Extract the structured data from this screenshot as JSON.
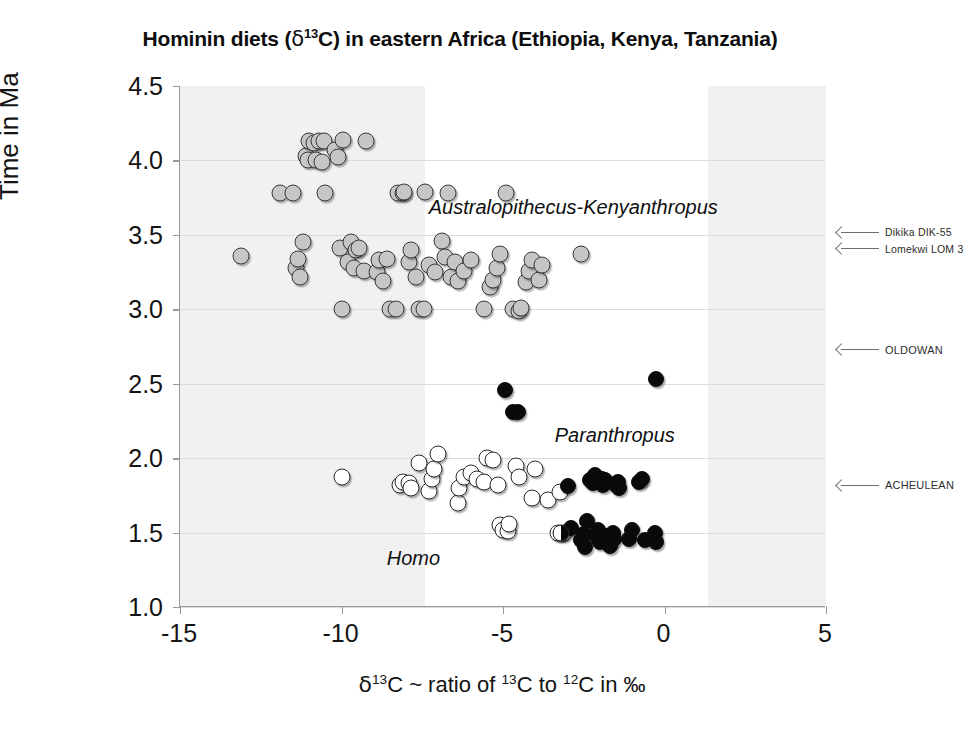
{
  "chart_data": {
    "type": "scatter",
    "title": "Hominin diets (δ13C) in eastern Africa (Ethiopia, Kenya, Tanzania)",
    "title_parts": {
      "pre": "Hominin diets (",
      "delta": "δ",
      "sup": "13",
      "mid": "C) in eastern Africa (Ethiopia, Kenya, Tanzania)"
    },
    "xlabel": "δ13C ~ ratio of 13C to 12C in ‰",
    "xlabel_parts": {
      "delta": "δ",
      "sup1": "13",
      "t1": "C ~ ratio of ",
      "sup2": "13",
      "t2": "C to ",
      "sup3": "12",
      "t3": "C in ‰"
    },
    "ylabel": "Time in Ma",
    "xlim": [
      -15,
      5
    ],
    "ylim": [
      4.5,
      1.0
    ],
    "y_inverted": true,
    "xticks": [
      -15,
      -10,
      -5,
      0,
      5
    ],
    "xtick_labels": [
      "-15",
      "-10",
      "-5",
      "0",
      "5"
    ],
    "yticks": [
      1.0,
      1.5,
      2.0,
      2.5,
      3.0,
      3.5,
      4.0,
      4.5
    ],
    "ytick_labels": [
      "1.0",
      "1.5",
      "2.0",
      "2.5",
      "3.0",
      "3.5",
      "4.0",
      "4.5"
    ],
    "grid": "horizontal",
    "legend": "none",
    "shaded_bands": [
      {
        "name": "C4-poor-band",
        "x_from": -15,
        "x_to": -7.4,
        "color": "#f1f1f1"
      },
      {
        "name": "C4-rich-band",
        "x_from": 1.35,
        "x_to": 5,
        "color": "#f1f1f1"
      }
    ],
    "series": [
      {
        "name": "Homo",
        "marker": "open-circle",
        "color": "#ffffff",
        "edge_color": "#2b2b2b",
        "points": [
          [
            -10.0,
            1.87
          ],
          [
            -8.2,
            1.82
          ],
          [
            -8.1,
            1.84
          ],
          [
            -7.9,
            1.83
          ],
          [
            -7.85,
            1.8
          ],
          [
            -7.6,
            1.97
          ],
          [
            -7.3,
            1.78
          ],
          [
            -7.2,
            1.86
          ],
          [
            -7.15,
            1.93
          ],
          [
            -7.0,
            2.03
          ],
          [
            -6.4,
            1.7
          ],
          [
            -6.35,
            1.8
          ],
          [
            -6.2,
            1.87
          ],
          [
            -6.0,
            1.9
          ],
          [
            -5.8,
            1.86
          ],
          [
            -5.6,
            1.84
          ],
          [
            -5.5,
            2.0
          ],
          [
            -5.3,
            1.99
          ],
          [
            -5.15,
            1.82
          ],
          [
            -5.1,
            1.55
          ],
          [
            -5.0,
            1.52
          ],
          [
            -4.85,
            1.51
          ],
          [
            -4.8,
            1.56
          ],
          [
            -4.6,
            1.95
          ],
          [
            -4.5,
            1.87
          ],
          [
            -4.1,
            1.73
          ],
          [
            -4.0,
            1.93
          ],
          [
            -3.6,
            1.72
          ],
          [
            -3.3,
            1.5
          ],
          [
            -3.25,
            1.77
          ],
          [
            -3.1,
            1.5
          ]
        ]
      },
      {
        "name": "Paranthropus",
        "marker": "filled-circle",
        "color": "#0a0a0a",
        "edge_color": "#0a0a0a",
        "points": [
          [
            -3.2,
            1.5
          ],
          [
            -3.0,
            1.81
          ],
          [
            -2.9,
            1.53
          ],
          [
            -2.6,
            1.45
          ],
          [
            -2.5,
            1.49
          ],
          [
            -2.45,
            1.4
          ],
          [
            -2.4,
            1.58
          ],
          [
            -2.3,
            1.85
          ],
          [
            -2.25,
            1.86
          ],
          [
            -2.2,
            1.83
          ],
          [
            -2.15,
            1.89
          ],
          [
            -2.1,
            1.47
          ],
          [
            -2.05,
            1.52
          ],
          [
            -2.0,
            1.44
          ],
          [
            -1.95,
            1.86
          ],
          [
            -1.9,
            1.82
          ],
          [
            -1.85,
            1.85
          ],
          [
            -1.8,
            1.48
          ],
          [
            -1.75,
            1.44
          ],
          [
            -1.7,
            1.41
          ],
          [
            -1.6,
            1.5
          ],
          [
            -1.55,
            1.46
          ],
          [
            -1.5,
            1.82
          ],
          [
            -1.45,
            1.84
          ],
          [
            -1.4,
            1.8
          ],
          [
            -1.1,
            1.46
          ],
          [
            -1.0,
            1.52
          ],
          [
            -0.8,
            1.84
          ],
          [
            -0.7,
            1.86
          ],
          [
            -0.6,
            1.45
          ],
          [
            -0.3,
            1.5
          ],
          [
            -0.25,
            1.44
          ],
          [
            -4.95,
            2.46
          ],
          [
            -4.7,
            2.31
          ],
          [
            -4.55,
            2.31
          ],
          [
            -0.25,
            2.53
          ]
        ]
      },
      {
        "name": "Australopithecus-Kenyanthropus",
        "marker": "gray-circle",
        "color": "#c6c6c6",
        "edge_color": "#3a3a3a",
        "points": [
          [
            -13.1,
            3.36
          ],
          [
            -11.9,
            3.78
          ],
          [
            -11.5,
            3.78
          ],
          [
            -11.4,
            3.28
          ],
          [
            -11.35,
            3.34
          ],
          [
            -11.3,
            3.22
          ],
          [
            -11.2,
            3.45
          ],
          [
            -11.1,
            4.03
          ],
          [
            -11.05,
            4.0
          ],
          [
            -11.0,
            4.13
          ],
          [
            -10.85,
            4.12
          ],
          [
            -10.8,
            4.0
          ],
          [
            -10.7,
            4.13
          ],
          [
            -10.6,
            3.99
          ],
          [
            -10.55,
            4.13
          ],
          [
            -10.5,
            3.78
          ],
          [
            -10.2,
            4.07
          ],
          [
            -10.1,
            4.02
          ],
          [
            -10.05,
            3.41
          ],
          [
            -10.0,
            3.0
          ],
          [
            -9.95,
            4.14
          ],
          [
            -9.8,
            3.32
          ],
          [
            -9.7,
            3.45
          ],
          [
            -9.6,
            3.28
          ],
          [
            -9.55,
            3.4
          ],
          [
            -9.45,
            3.41
          ],
          [
            -9.3,
            3.26
          ],
          [
            -9.25,
            4.13
          ],
          [
            -8.9,
            3.25
          ],
          [
            -8.85,
            3.33
          ],
          [
            -8.7,
            3.19
          ],
          [
            -8.6,
            3.34
          ],
          [
            -8.5,
            3.0
          ],
          [
            -8.3,
            3.0
          ],
          [
            -8.25,
            3.78
          ],
          [
            -8.1,
            3.78
          ],
          [
            -8.05,
            3.79
          ],
          [
            -7.9,
            3.32
          ],
          [
            -7.85,
            3.4
          ],
          [
            -7.7,
            3.22
          ],
          [
            -7.6,
            3.0
          ],
          [
            -7.45,
            3.0
          ],
          [
            -7.4,
            3.79
          ],
          [
            -7.3,
            3.3
          ],
          [
            -7.1,
            3.25
          ],
          [
            -6.9,
            3.46
          ],
          [
            -6.8,
            3.35
          ],
          [
            -6.7,
            3.78
          ],
          [
            -6.6,
            3.22
          ],
          [
            -6.5,
            3.32
          ],
          [
            -6.4,
            3.19
          ],
          [
            -6.2,
            3.26
          ],
          [
            -6.0,
            3.33
          ],
          [
            -5.6,
            3.0
          ],
          [
            -5.4,
            3.15
          ],
          [
            -5.3,
            3.2
          ],
          [
            -5.2,
            3.28
          ],
          [
            -5.1,
            3.37
          ],
          [
            -4.9,
            3.78
          ],
          [
            -4.7,
            3.0
          ],
          [
            -4.5,
            2.99
          ],
          [
            -4.45,
            3.01
          ],
          [
            -4.3,
            3.18
          ],
          [
            -4.2,
            3.26
          ],
          [
            -4.1,
            3.33
          ],
          [
            -3.9,
            3.2
          ],
          [
            -3.8,
            3.3
          ],
          [
            -2.6,
            3.37
          ]
        ]
      }
    ],
    "taxon_labels": [
      {
        "id": "homo",
        "text": "Homo",
        "x": -8.6,
        "y": 1.32
      },
      {
        "id": "paranthropus",
        "text": "Paranthropus",
        "x": -3.4,
        "y": 2.15
      },
      {
        "id": "australopithecus",
        "text": "Australopithecus-Kenyanthropus",
        "x": -7.3,
        "y": 3.68
      }
    ],
    "annotations": [
      {
        "id": "acheulean",
        "text": "ACHEULEAN",
        "y": 1.81,
        "size": "normal"
      },
      {
        "id": "oldowan",
        "text": "OLDOWAN",
        "y": 2.72,
        "size": "normal"
      },
      {
        "id": "lomekwi",
        "text": "Lomekwi LOM 3",
        "y": 3.4,
        "size": "small"
      },
      {
        "id": "dikika",
        "text": "Dikika DIK-55",
        "y": 3.51,
        "size": "small"
      }
    ]
  }
}
